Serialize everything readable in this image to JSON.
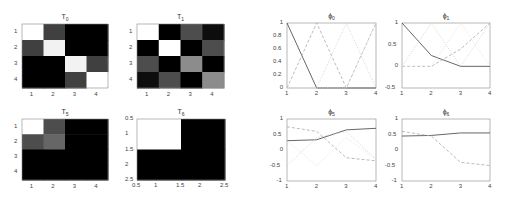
{
  "chart_data": [
    {
      "type": "heatmap",
      "id": "T0",
      "title": "T",
      "title_sub": "0",
      "xticks": [
        "1",
        "2",
        "3",
        "4"
      ],
      "yticks": [
        "1",
        "2",
        "3",
        "4"
      ],
      "matrix": [
        [
          1.0,
          0.25,
          0.0,
          0.0
        ],
        [
          0.25,
          0.95,
          0.0,
          0.0
        ],
        [
          0.0,
          0.0,
          0.95,
          0.25
        ],
        [
          0.0,
          0.0,
          0.25,
          1.0
        ]
      ]
    },
    {
      "type": "heatmap",
      "id": "T1",
      "title": "T",
      "title_sub": "1",
      "xticks": [
        "1",
        "2",
        "3",
        "4"
      ],
      "yticks": [
        "1",
        "2",
        "3",
        "4"
      ],
      "matrix": [
        [
          1.0,
          0.0,
          0.3,
          0.05
        ],
        [
          0.0,
          1.0,
          0.0,
          0.3
        ],
        [
          0.3,
          0.0,
          0.55,
          0.0
        ],
        [
          0.05,
          0.3,
          0.0,
          0.55
        ]
      ]
    },
    {
      "type": "heatmap",
      "id": "T5",
      "title": "T",
      "title_sub": "5",
      "xticks": [
        "1",
        "2",
        "3",
        "4"
      ],
      "yticks": [
        "1",
        "2",
        "3",
        "4"
      ],
      "matrix": [
        [
          1.0,
          0.3,
          0.0,
          0.0
        ],
        [
          0.3,
          0.4,
          0.0,
          0.0
        ],
        [
          0.0,
          0.0,
          0.0,
          0.0
        ],
        [
          0.0,
          0.0,
          0.0,
          0.0
        ]
      ]
    },
    {
      "type": "heatmap",
      "id": "T6",
      "title": "T",
      "title_sub": "6",
      "xticks": [
        "0.5",
        "1",
        "1.5",
        "2",
        "2.5"
      ],
      "yticks": [
        "0.5",
        "1",
        "1.5",
        "2",
        "2.5"
      ],
      "matrix": [
        [
          1.0,
          0.0
        ],
        [
          0.0,
          0.0
        ]
      ]
    },
    {
      "type": "line",
      "id": "phi0",
      "title": "ϕ",
      "title_sub": "0",
      "x": [
        1,
        2,
        3,
        4
      ],
      "xlim": [
        1,
        4
      ],
      "ylim": [
        0,
        1
      ],
      "xticks": [
        "1",
        "2",
        "3",
        "4"
      ],
      "yticks": [
        "0",
        "0.2",
        "0.4",
        "0.6",
        "0.8",
        "1"
      ],
      "series": [
        {
          "name": "solid",
          "style": "solid",
          "color": "#555555",
          "values": [
            1,
            0,
            0,
            0
          ]
        },
        {
          "name": "dashed",
          "style": "dashed",
          "color": "#aaaaaa",
          "values": [
            0,
            1,
            0,
            1
          ]
        },
        {
          "name": "dotted-a",
          "style": "dotted",
          "color": "#cccccc",
          "values": [
            0,
            0,
            1,
            0
          ]
        },
        {
          "name": "dotted-b",
          "style": "dotted",
          "color": "#dddddd",
          "values": [
            0,
            0,
            0,
            1
          ]
        }
      ]
    },
    {
      "type": "line",
      "id": "phi1",
      "title": "ϕ",
      "title_sub": "1",
      "x": [
        1,
        2,
        3,
        4
      ],
      "xlim": [
        1,
        4
      ],
      "ylim": [
        -0.5,
        1
      ],
      "xticks": [
        "1",
        "2",
        "3",
        "4"
      ],
      "yticks": [
        "-0.5",
        "0",
        "0.5",
        "1"
      ],
      "series": [
        {
          "name": "solid",
          "style": "solid",
          "color": "#555555",
          "values": [
            1,
            0.25,
            0,
            0
          ]
        },
        {
          "name": "dashed",
          "style": "dashed",
          "color": "#aaaaaa",
          "values": [
            0,
            0,
            0.4,
            1
          ]
        },
        {
          "name": "dotted-a",
          "style": "dotted",
          "color": "#cccccc",
          "values": [
            0,
            1,
            0,
            1
          ]
        },
        {
          "name": "dotted-b",
          "style": "dotted",
          "color": "#dddddd",
          "values": [
            0,
            0,
            1,
            0
          ]
        }
      ]
    },
    {
      "type": "line",
      "id": "phi5",
      "title": "ϕ",
      "title_sub": "5",
      "x": [
        1,
        2,
        3,
        4
      ],
      "xlim": [
        1,
        4
      ],
      "ylim": [
        -1,
        1
      ],
      "xticks": [
        "1",
        "2",
        "3",
        "4"
      ],
      "yticks": [
        "-1",
        "-0.5",
        "0",
        "0.5",
        "1"
      ],
      "series": [
        {
          "name": "solid",
          "style": "solid",
          "color": "#555555",
          "values": [
            0.3,
            0.33,
            0.65,
            0.7
          ]
        },
        {
          "name": "dashed",
          "style": "dashed",
          "color": "#aaaaaa",
          "values": [
            0.75,
            0.6,
            -0.25,
            -0.35
          ]
        },
        {
          "name": "dotted-a",
          "style": "dotted",
          "color": "#cccccc",
          "values": [
            -0.5,
            0.4,
            0.6,
            -0.3
          ]
        },
        {
          "name": "dotted-b",
          "style": "dotted",
          "color": "#dddddd",
          "values": [
            0.3,
            -0.5,
            0.4,
            -0.3
          ]
        }
      ]
    },
    {
      "type": "line",
      "id": "phi6",
      "title": "ϕ",
      "title_sub": "6",
      "x": [
        1,
        2,
        3,
        4
      ],
      "xlim": [
        1,
        4
      ],
      "ylim": [
        -1,
        1
      ],
      "xticks": [
        "1",
        "2",
        "3",
        "4"
      ],
      "yticks": [
        "-1",
        "-0.5",
        "0",
        "0.5",
        "1"
      ],
      "series": [
        {
          "name": "solid",
          "style": "solid",
          "color": "#555555",
          "values": [
            0.45,
            0.47,
            0.55,
            0.55
          ]
        },
        {
          "name": "dashed",
          "style": "dashed",
          "color": "#aaaaaa",
          "values": [
            0.6,
            0.45,
            -0.4,
            -0.5
          ]
        }
      ]
    }
  ]
}
